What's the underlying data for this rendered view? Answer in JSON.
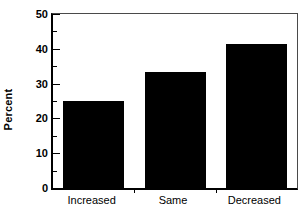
{
  "chart_data": {
    "type": "bar",
    "title": "",
    "xlabel": "",
    "ylabel": "Percent",
    "categories": [
      "Increased",
      "Same",
      "Decreased"
    ],
    "values": [
      25.0,
      33.3,
      41.4
    ],
    "ylim": [
      0,
      50
    ],
    "yticks": [
      0,
      10,
      20,
      30,
      40,
      50
    ],
    "ytick_labels": [
      "0",
      "10",
      "20",
      "30",
      "40",
      "50"
    ],
    "yminor_ticks": [
      5,
      15,
      25,
      35,
      45
    ],
    "grid": false,
    "legend": null,
    "bar_color": "#000000",
    "background_color": "#ffffff",
    "axis_color": "#000000",
    "frame_color": "#4a4a4a"
  }
}
